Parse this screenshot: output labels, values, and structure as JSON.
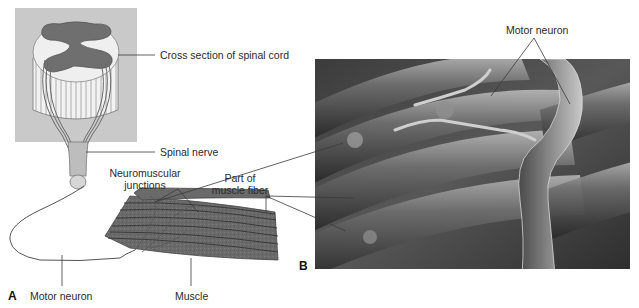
{
  "figure": {
    "panels": [
      {
        "letter": "A",
        "type": "illustration",
        "labels": {
          "cross_section": "Cross section of spinal cord",
          "spinal_nerve": "Spinal nerve",
          "nmj_line1": "Neuromuscular",
          "nmj_line2": "junctions",
          "muscle_fiber_line1": "Part of",
          "muscle_fiber_line2": "muscle fiber",
          "motor_neuron": "Motor neuron",
          "muscle": "Muscle"
        }
      },
      {
        "letter": "B",
        "type": "scanning-electron-micrograph",
        "labels": {
          "motor_neuron": "Motor neuron"
        }
      }
    ]
  },
  "colors": {
    "background_box": "#c9c9c9",
    "gray_matter": "#6f6f6f",
    "white_matter": "#efefef",
    "muscle": "#6a6a6a",
    "leader_line": "#3a3a3a",
    "micrograph_dark": "#2a2a2a",
    "micrograph_light": "#9a9a9a"
  }
}
